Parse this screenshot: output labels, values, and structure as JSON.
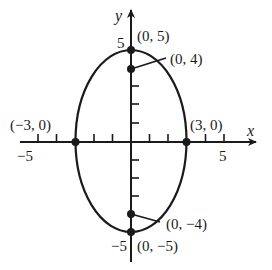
{
  "diagram": {
    "type": "ellipse-graph",
    "equation_shape": "vertical ellipse centered at origin",
    "semi_major_axis": 5,
    "semi_minor_axis": 3,
    "axes": {
      "x_label": "x",
      "y_label": "y",
      "x_tick_labels": [
        {
          "value": -5,
          "text": "−5"
        },
        {
          "value": 5,
          "text": "5"
        }
      ],
      "y_tick_labels": [
        {
          "value": 5,
          "text": "5"
        },
        {
          "value": -5,
          "text": "−5"
        }
      ],
      "x_ticks": [
        -5,
        -4,
        -2,
        -1,
        1,
        2,
        4,
        5
      ],
      "y_ticks": [
        -4,
        -3,
        -2,
        -1,
        1,
        2,
        3,
        4,
        5,
        -5
      ]
    },
    "points": [
      {
        "name": "vertex-top",
        "x": 0,
        "y": 5,
        "label": "(0, 5)"
      },
      {
        "name": "focus-top",
        "x": 0,
        "y": 4,
        "label": "(0, 4)"
      },
      {
        "name": "covertex-left",
        "x": -3,
        "y": 0,
        "label": "(−3, 0)"
      },
      {
        "name": "covertex-right",
        "x": 3,
        "y": 0,
        "label": "(3, 0)"
      },
      {
        "name": "focus-bottom",
        "x": 0,
        "y": -4,
        "label": "(0, −4)"
      },
      {
        "name": "vertex-bottom",
        "x": 0,
        "y": -5,
        "label": "(0, −5)"
      }
    ],
    "colors": {
      "stroke": "#1a1a1a",
      "background": "#ffffff"
    }
  }
}
